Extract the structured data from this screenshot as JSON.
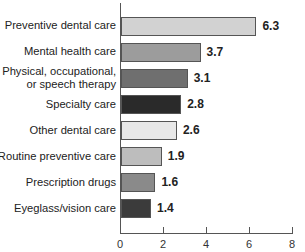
{
  "chart_data": {
    "type": "bar",
    "orientation": "horizontal",
    "title": "",
    "xlabel": "",
    "ylabel": "",
    "xlim": [
      0,
      8
    ],
    "xticks": [
      "0",
      "2",
      "4",
      "6",
      "8"
    ],
    "grid": false,
    "legend": null,
    "categories": [
      "Preventive dental care",
      "Mental health care",
      "Physical, occupational, or speech therapy",
      "Specialty care",
      "Other dental care",
      "Routine preventive care",
      "Prescription drugs",
      "Eyeglass/vision care"
    ],
    "values": [
      6.3,
      3.7,
      3.1,
      2.8,
      2.6,
      1.9,
      1.6,
      1.4
    ],
    "value_labels": [
      "6.3",
      "3.7",
      "3.1",
      "2.8",
      "2.6",
      "1.9",
      "1.6",
      "1.4"
    ],
    "bar_colors": [
      "#d2d2d2",
      "#9c9c9c",
      "#6f6f6f",
      "#2a2a2a",
      "#e8e8e8",
      "#bdbdbd",
      "#8a8a8a",
      "#3b3b3b"
    ]
  },
  "labels": {
    "cat0": "Preventive dental care",
    "cat1": "Mental health care",
    "cat2a": "Physical, occupational,",
    "cat2b": "or speech therapy",
    "cat3": "Specialty care",
    "cat4": "Other dental care",
    "cat5": "Routine preventive care",
    "cat6": "Prescription drugs",
    "cat7": "Eyeglass/vision care"
  }
}
